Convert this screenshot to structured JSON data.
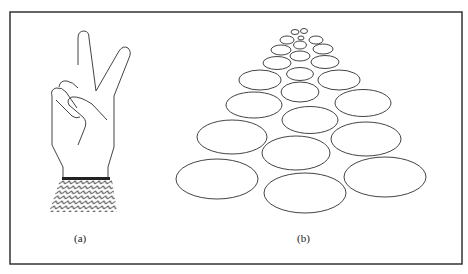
{
  "figure": {
    "frame": {
      "x": 10,
      "y": 12,
      "width": 452,
      "height": 252,
      "stroke": "#333333"
    },
    "panels": [
      {
        "id": "a",
        "caption": "(a)",
        "content": "hand making V / peace sign with patterned cuff"
      },
      {
        "id": "b",
        "caption": "(b)",
        "content": "ellipses arranged in a receding perspective (trapezoid) grid"
      }
    ]
  },
  "colors": {
    "stroke": "#444444",
    "background": "#ffffff"
  },
  "ellipses": [
    {
      "cx": 295,
      "cy": 32,
      "rx": 4,
      "ry": 2.5
    },
    {
      "cx": 304,
      "cy": 31,
      "rx": 3.5,
      "ry": 2.5
    },
    {
      "cx": 301,
      "cy": 38,
      "rx": 3,
      "ry": 2
    },
    {
      "cx": 287,
      "cy": 40,
      "rx": 7,
      "ry": 4
    },
    {
      "cx": 300,
      "cy": 45,
      "rx": 6.5,
      "ry": 4
    },
    {
      "cx": 316,
      "cy": 40,
      "rx": 7,
      "ry": 4
    },
    {
      "cx": 281,
      "cy": 50,
      "rx": 10,
      "ry": 5
    },
    {
      "cx": 300,
      "cy": 56,
      "rx": 10,
      "ry": 5
    },
    {
      "cx": 323,
      "cy": 49,
      "rx": 10,
      "ry": 5
    },
    {
      "cx": 277,
      "cy": 63,
      "rx": 14,
      "ry": 6.5
    },
    {
      "cx": 300,
      "cy": 74,
      "rx": 13.5,
      "ry": 6.5
    },
    {
      "cx": 325,
      "cy": 62,
      "rx": 14,
      "ry": 6.5
    },
    {
      "cx": 260,
      "cy": 80,
      "rx": 21,
      "ry": 10
    },
    {
      "cx": 300,
      "cy": 92,
      "rx": 19,
      "ry": 10
    },
    {
      "cx": 339,
      "cy": 80,
      "rx": 21,
      "ry": 10
    },
    {
      "cx": 254,
      "cy": 105,
      "rx": 28,
      "ry": 13
    },
    {
      "cx": 310,
      "cy": 120,
      "rx": 28,
      "ry": 13.5
    },
    {
      "cx": 363,
      "cy": 103,
      "rx": 28,
      "ry": 13.5
    },
    {
      "cx": 232,
      "cy": 137,
      "rx": 35,
      "ry": 17
    },
    {
      "cx": 296,
      "cy": 153,
      "rx": 34,
      "ry": 17
    },
    {
      "cx": 366,
      "cy": 139,
      "rx": 35,
      "ry": 17
    },
    {
      "cx": 217,
      "cy": 179,
      "rx": 41,
      "ry": 20
    },
    {
      "cx": 305,
      "cy": 193,
      "rx": 41,
      "ry": 20
    },
    {
      "cx": 385,
      "cy": 177,
      "rx": 41,
      "ry": 20
    }
  ]
}
